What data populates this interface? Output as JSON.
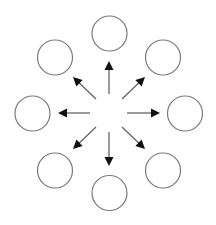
{
  "diagram": {
    "type": "radial-divergence",
    "background": "#ffffff",
    "center": {
      "x": 109,
      "y": 113
    },
    "node_style": {
      "radius": 17.5,
      "stroke": "#7a7a7a",
      "stroke_width": 1.2,
      "fill": "#ffffff"
    },
    "arrow_style": {
      "shaft_color": "#666666",
      "head_color": "#111111",
      "shaft_width": 1.3
    },
    "nodes": [
      {
        "id": "top",
        "cx": 109.5,
        "cy": 33.5
      },
      {
        "id": "top-right",
        "cx": 163,
        "cy": 57.5
      },
      {
        "id": "right",
        "cx": 185,
        "cy": 113.5
      },
      {
        "id": "bottom-right",
        "cx": 163,
        "cy": 170.5
      },
      {
        "id": "bottom",
        "cx": 109.5,
        "cy": 193
      },
      {
        "id": "bottom-left",
        "cx": 55,
        "cy": 170.5
      },
      {
        "id": "left",
        "cx": 32.5,
        "cy": 113.5
      },
      {
        "id": "top-left",
        "cx": 55,
        "cy": 57.5
      }
    ],
    "arrows": [
      {
        "id": "to-top",
        "x1": 109,
        "y1": 94,
        "x2": 109,
        "y2": 61
      },
      {
        "id": "to-top-right",
        "x1": 122,
        "y1": 99,
        "x2": 145,
        "y2": 77
      },
      {
        "id": "to-right",
        "x1": 127,
        "y1": 113,
        "x2": 160,
        "y2": 113
      },
      {
        "id": "to-bottom-right",
        "x1": 122,
        "y1": 127,
        "x2": 145,
        "y2": 149
      },
      {
        "id": "to-bottom",
        "x1": 109,
        "y1": 132,
        "x2": 109,
        "y2": 166
      },
      {
        "id": "to-bottom-left",
        "x1": 96,
        "y1": 127,
        "x2": 73,
        "y2": 149
      },
      {
        "id": "to-left",
        "x1": 90,
        "y1": 113,
        "x2": 58,
        "y2": 113
      },
      {
        "id": "to-top-left",
        "x1": 96,
        "y1": 99,
        "x2": 73,
        "y2": 77
      }
    ]
  }
}
